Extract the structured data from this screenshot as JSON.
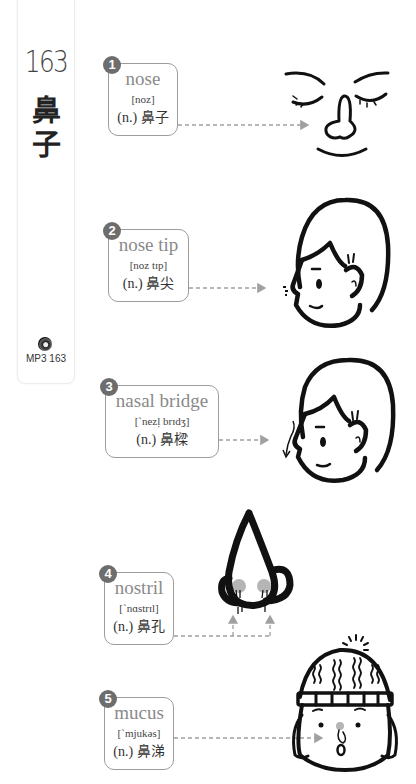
{
  "sidebar": {
    "lesson_number": "163",
    "title_zh_1": "鼻",
    "title_zh_2": "子",
    "audio_icon": "cd-icon",
    "audio_label": "MP3 163"
  },
  "entries": [
    {
      "number": "1",
      "word": "nose",
      "phonetic": "[noz]",
      "translation": "(n.) 鼻子",
      "illustration": "face-closed-eyes-nose"
    },
    {
      "number": "2",
      "word": "nose tip",
      "phonetic": "[noz tɪp]",
      "translation": "(n.) 鼻尖",
      "illustration": "boy-profile-nose-tip"
    },
    {
      "number": "3",
      "word": "nasal bridge",
      "phonetic": "[ˋnezḷ brɪdʒ]",
      "translation": "(n.) 鼻樑",
      "illustration": "boy-profile-nasal-bridge"
    },
    {
      "number": "4",
      "word": "nostril",
      "phonetic": "[ˋnɑstrɪl]",
      "translation": "(n.) 鼻孔",
      "illustration": "nose-closeup-nostrils"
    },
    {
      "number": "5",
      "word": "mucus",
      "phonetic": "[ˋmjukəs]",
      "translation": "(n.) 鼻涕",
      "illustration": "child-beanie-runny-nose"
    }
  ],
  "colors": {
    "badge": "#6d6d6d",
    "card_border": "#9c9c9c",
    "word": "#8a8a8a",
    "arrow": "#a0a0a0",
    "nostril_shade": "#b5b5b5",
    "ink": "#111111"
  }
}
